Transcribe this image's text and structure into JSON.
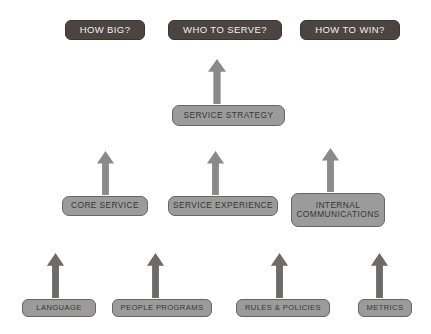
{
  "diagram": {
    "background_color": "#ffffff",
    "question_color": "#4b4440",
    "box_color": "#9b9b9b",
    "arrow_color_upper": "#8a8a8a",
    "arrow_color_lower": "#6e6a68",
    "questions": [
      {
        "label": "HOW BIG?",
        "x": 65,
        "y": 20,
        "w": 80,
        "h": 20
      },
      {
        "label": "WHO TO SERVE?",
        "x": 168,
        "y": 20,
        "w": 114,
        "h": 20
      },
      {
        "label": "HOW TO WIN?",
        "x": 300,
        "y": 20,
        "w": 100,
        "h": 20
      }
    ],
    "strategy": {
      "label": "SERVICE STRATEGY",
      "x": 172,
      "y": 105,
      "w": 113,
      "h": 21
    },
    "pillars": [
      {
        "label": "CORE SERVICE",
        "x": 62,
        "y": 196,
        "w": 86,
        "h": 20
      },
      {
        "label": "SERVICE EXPERIENCE",
        "x": 168,
        "y": 196,
        "w": 110,
        "h": 20
      },
      {
        "label": "INTERNAL\nCOMMUNICATIONS",
        "x": 291,
        "y": 193,
        "w": 94,
        "h": 34
      }
    ],
    "foundations": [
      {
        "label": "LANGUAGE",
        "x": 22,
        "y": 299,
        "w": 74,
        "h": 18
      },
      {
        "label": "PEOPLE PROGRAMS",
        "x": 112,
        "y": 299,
        "w": 100,
        "h": 18
      },
      {
        "label": "RULES & POLICIES",
        "x": 236,
        "y": 299,
        "w": 94,
        "h": 18
      },
      {
        "label": "METRICS",
        "x": 358,
        "y": 299,
        "w": 54,
        "h": 18
      }
    ],
    "arrows": [
      {
        "name": "arrow-strategy-up",
        "x": 207,
        "y": 58,
        "w": 20,
        "h": 47,
        "tone": "upper"
      },
      {
        "name": "arrow-core-service-up",
        "x": 96,
        "y": 150,
        "w": 19,
        "h": 46,
        "tone": "upper"
      },
      {
        "name": "arrow-service-exp-up",
        "x": 206,
        "y": 150,
        "w": 19,
        "h": 46,
        "tone": "upper"
      },
      {
        "name": "arrow-internal-comms-up",
        "x": 321,
        "y": 147,
        "w": 19,
        "h": 46,
        "tone": "upper"
      },
      {
        "name": "arrow-language-up",
        "x": 46,
        "y": 252,
        "w": 19,
        "h": 47,
        "tone": "lower"
      },
      {
        "name": "arrow-people-programs-up",
        "x": 146,
        "y": 252,
        "w": 19,
        "h": 47,
        "tone": "lower"
      },
      {
        "name": "arrow-rules-policies-up",
        "x": 270,
        "y": 252,
        "w": 19,
        "h": 47,
        "tone": "lower"
      },
      {
        "name": "arrow-metrics-up",
        "x": 370,
        "y": 252,
        "w": 19,
        "h": 47,
        "tone": "lower"
      }
    ]
  }
}
